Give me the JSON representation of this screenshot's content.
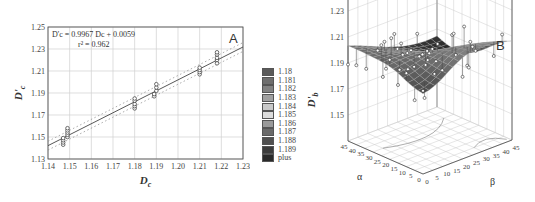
{
  "chart_data": [
    {
      "id": "A",
      "type": "scatter",
      "panel_label": "A",
      "title": "",
      "xlabel": "Dc",
      "ylabel": "D'c",
      "xlim": [
        1.14,
        1.23
      ],
      "ylim": [
        1.13,
        1.25
      ],
      "x_ticks": [
        "1.14",
        "1.15",
        "1.16",
        "1.17",
        "1.18",
        "1.19",
        "1.20",
        "1.21",
        "1.22",
        "1.23"
      ],
      "y_ticks": [
        "1.13",
        "1.15",
        "1.17",
        "1.19",
        "1.21",
        "1.23",
        "1.25"
      ],
      "grid": true,
      "annotation": {
        "equation": "D'c = 0.9967 Dc + 0.0059",
        "r2": "r² = 0.962"
      },
      "fit_line": {
        "slope": 0.9967,
        "intercept": 0.0059,
        "style": "solid"
      },
      "confidence_band": {
        "style": "dotted",
        "half_width": 0.004
      },
      "series": [
        {
          "name": "observed",
          "points": [
            {
              "x": 1.147,
              "y": 1.143
            },
            {
              "x": 1.147,
              "y": 1.145
            },
            {
              "x": 1.147,
              "y": 1.147
            },
            {
              "x": 1.147,
              "y": 1.149
            },
            {
              "x": 1.149,
              "y": 1.15
            },
            {
              "x": 1.149,
              "y": 1.152
            },
            {
              "x": 1.149,
              "y": 1.154
            },
            {
              "x": 1.149,
              "y": 1.156
            },
            {
              "x": 1.149,
              "y": 1.158
            },
            {
              "x": 1.18,
              "y": 1.176
            },
            {
              "x": 1.18,
              "y": 1.178
            },
            {
              "x": 1.18,
              "y": 1.18
            },
            {
              "x": 1.18,
              "y": 1.183
            },
            {
              "x": 1.18,
              "y": 1.185
            },
            {
              "x": 1.189,
              "y": 1.187
            },
            {
              "x": 1.189,
              "y": 1.189
            },
            {
              "x": 1.19,
              "y": 1.192
            },
            {
              "x": 1.19,
              "y": 1.195
            },
            {
              "x": 1.19,
              "y": 1.198
            },
            {
              "x": 1.21,
              "y": 1.207
            },
            {
              "x": 1.21,
              "y": 1.209
            },
            {
              "x": 1.21,
              "y": 1.211
            },
            {
              "x": 1.21,
              "y": 1.213
            },
            {
              "x": 1.218,
              "y": 1.217
            },
            {
              "x": 1.218,
              "y": 1.22
            },
            {
              "x": 1.218,
              "y": 1.222
            },
            {
              "x": 1.218,
              "y": 1.225
            },
            {
              "x": 1.218,
              "y": 1.227
            }
          ]
        }
      ]
    },
    {
      "id": "B",
      "type": "surface3d",
      "panel_label": "B",
      "zlabel": "D'b",
      "xlabel": "α",
      "ylabel": "β",
      "zlim": [
        1.13,
        1.25
      ],
      "z_ticks": [
        "1.15",
        "1.17",
        "1.19",
        "1.21",
        "1.23",
        "1.25"
      ],
      "alpha_ticks": [
        "45",
        "40",
        "35",
        "30",
        "25",
        "20",
        "15",
        "10",
        "5",
        "0"
      ],
      "beta_ticks": [
        "0",
        "5",
        "10",
        "15",
        "20",
        "25",
        "30",
        "35",
        "40",
        "45"
      ],
      "alpha_range": [
        0,
        45
      ],
      "beta_range": [
        0,
        45
      ],
      "surface_z_range": [
        1.175,
        1.215
      ],
      "legend": {
        "title": "",
        "position": "left of panel B",
        "entries": [
          {
            "label": "1.18",
            "color": "#5a5a5a"
          },
          {
            "label": "1.181",
            "color": "#6e6e6e"
          },
          {
            "label": "1.182",
            "color": "#828282"
          },
          {
            "label": "1.183",
            "color": "#a0a0a0"
          },
          {
            "label": "1.184",
            "color": "#c8c8c8"
          },
          {
            "label": "1.185",
            "color": "#dcdcdc"
          },
          {
            "label": "1.186",
            "color": "#9a9a9a"
          },
          {
            "label": "1.187",
            "color": "#6a6a6a"
          },
          {
            "label": "1.188",
            "color": "#505050"
          },
          {
            "label": "1.189",
            "color": "#3c3c3c"
          },
          {
            "label": "plus",
            "color": "#2a2a2a"
          }
        ]
      }
    }
  ]
}
